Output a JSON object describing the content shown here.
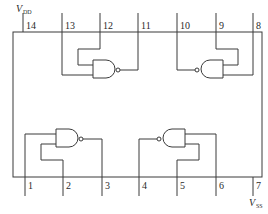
{
  "diagram": {
    "type": "ic-pinout",
    "supply": {
      "vdd": {
        "label": "V",
        "subscript": "DD",
        "pin": "14"
      },
      "vss": {
        "label": "V",
        "subscript": "SS",
        "pin": "7"
      }
    },
    "pins_top": [
      "14",
      "13",
      "12",
      "11",
      "10",
      "9",
      "8"
    ],
    "pins_bottom": [
      "1",
      "2",
      "3",
      "4",
      "5",
      "6",
      "7"
    ],
    "gates": [
      {
        "name": "gate-1",
        "inputs": [
          "1",
          "2"
        ],
        "output": "3"
      },
      {
        "name": "gate-2",
        "inputs": [
          "5",
          "6"
        ],
        "output": "4"
      },
      {
        "name": "gate-3",
        "inputs": [
          "12",
          "13"
        ],
        "output": "11"
      },
      {
        "name": "gate-4",
        "inputs": [
          "8",
          "9"
        ],
        "output": "10"
      }
    ],
    "colors": {
      "line": "#3a3a3a",
      "background": "#ffffff"
    }
  }
}
